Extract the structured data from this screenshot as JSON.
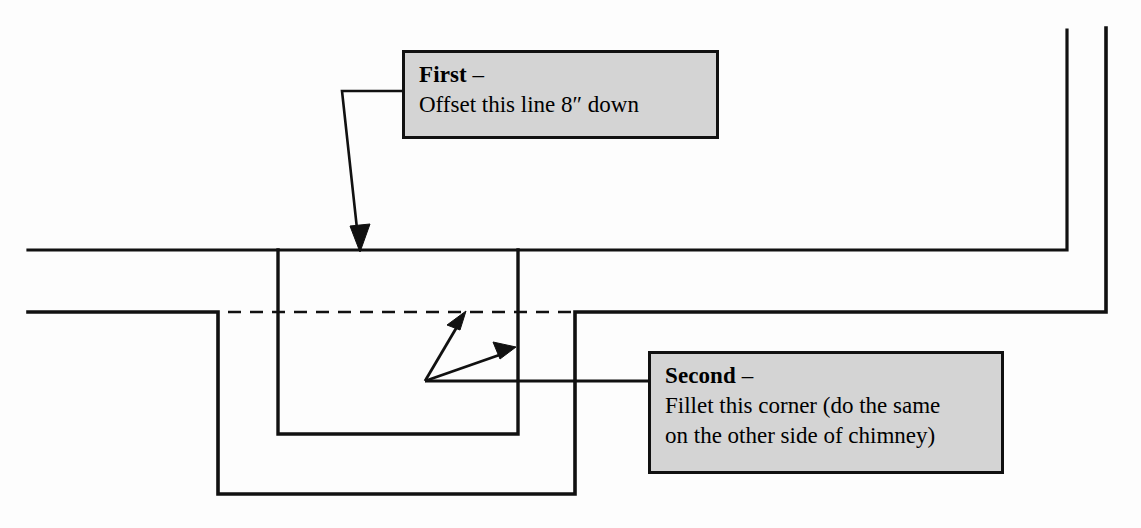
{
  "drawing": {
    "title": "Chimney flashing detail with revision callouts",
    "background_color": "#fdfdfd",
    "line_color": "#111111",
    "callout_fill": "#d4d4d4",
    "callout_border": "#111111"
  },
  "callouts": [
    {
      "id": "first",
      "heading": "First",
      "dash": " –",
      "lines": [
        "Offset this line 8″ down"
      ],
      "box": {
        "x": 402,
        "y": 50,
        "w": 317,
        "h": 89
      }
    },
    {
      "id": "second",
      "heading": "Second",
      "dash": " –",
      "lines": [
        "Fillet this corner (do the same",
        "on the other side of chimney)"
      ],
      "box": {
        "x": 648,
        "y": 351,
        "w": 356,
        "h": 123
      }
    }
  ],
  "chart_data": {
    "type": "diagram",
    "units": "pixels",
    "viewbox": [
      0,
      0,
      1141,
      528
    ],
    "solid_polylines": [
      {
        "name": "upper-roof-line",
        "points": [
          [
            28,
            250
          ],
          [
            1067,
            250
          ],
          [
            1067,
            30
          ]
        ]
      },
      {
        "name": "lower-roof-line-left",
        "points": [
          [
            28,
            312
          ],
          [
            218,
            312
          ],
          [
            218,
            494
          ],
          [
            575,
            494
          ],
          [
            575,
            312
          ],
          [
            1106,
            312
          ],
          [
            1106,
            28
          ]
        ]
      },
      {
        "name": "chimney-u-profile",
        "points": [
          [
            278,
            250
          ],
          [
            278,
            434
          ],
          [
            518,
            434
          ],
          [
            518,
            250
          ]
        ]
      }
    ],
    "dashed_polylines": [
      {
        "name": "offset-reference-line",
        "points": [
          [
            228,
            312
          ],
          [
            576,
            312
          ]
        ],
        "dash": [
          13,
          9
        ]
      }
    ],
    "leaders": [
      {
        "name": "first-leader",
        "points": [
          [
            402,
            91
          ],
          [
            342,
            91
          ],
          [
            360,
            243
          ]
        ],
        "arrow_at": [
          360,
          250
        ],
        "arrow_dir": "down"
      },
      {
        "name": "second-leader-stem",
        "points": [
          [
            648,
            381
          ],
          [
            425,
            381
          ]
        ],
        "arrow_at": null
      },
      {
        "name": "second-arrow-upper",
        "points": [
          [
            425,
            381
          ],
          [
            465,
            315
          ]
        ],
        "arrow_at": [
          465,
          313
        ],
        "arrow_dir": "up-right"
      },
      {
        "name": "second-arrow-lower",
        "points": [
          [
            425,
            381
          ],
          [
            511,
            350
          ]
        ],
        "arrow_at": [
          514,
          349
        ],
        "arrow_dir": "right-up"
      }
    ]
  }
}
